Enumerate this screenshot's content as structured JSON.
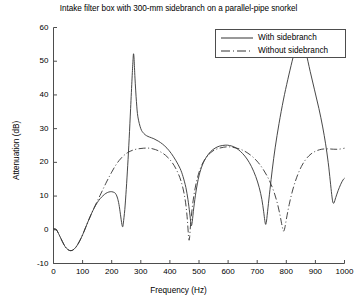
{
  "chart_data": {
    "type": "line",
    "title": "Intake filter box with 300-mm sidebranch on a parallel-pipe snorkel",
    "xlabel": "Frequency (Hz)",
    "ylabel": "Attenuation (dB)",
    "xlim": [
      0,
      1000
    ],
    "ylim": [
      -10,
      60
    ],
    "xticks": [
      0,
      100,
      200,
      300,
      400,
      500,
      600,
      700,
      800,
      900,
      1000
    ],
    "yticks": [
      -10,
      0,
      10,
      20,
      30,
      40,
      50,
      60
    ],
    "grid": false,
    "legend_position": "top-right",
    "series": [
      {
        "name": "With sidebranch",
        "style": "solid",
        "color": "#333333",
        "points": [
          [
            0,
            0.3
          ],
          [
            10,
            0.0
          ],
          [
            20,
            -1.6
          ],
          [
            30,
            -3.4
          ],
          [
            40,
            -5.0
          ],
          [
            50,
            -5.9
          ],
          [
            60,
            -6.2
          ],
          [
            70,
            -5.8
          ],
          [
            80,
            -4.8
          ],
          [
            90,
            -3.3
          ],
          [
            100,
            -1.5
          ],
          [
            110,
            0.6
          ],
          [
            120,
            2.7
          ],
          [
            130,
            4.7
          ],
          [
            140,
            6.5
          ],
          [
            150,
            8.0
          ],
          [
            160,
            9.2
          ],
          [
            170,
            10.1
          ],
          [
            180,
            10.8
          ],
          [
            190,
            11.2
          ],
          [
            200,
            11.3
          ],
          [
            210,
            11.0
          ],
          [
            215,
            10.5
          ],
          [
            220,
            9.4
          ],
          [
            225,
            7.5
          ],
          [
            230,
            4.6
          ],
          [
            235,
            1.6
          ],
          [
            238,
            0.9
          ],
          [
            240,
            2.0
          ],
          [
            245,
            6.0
          ],
          [
            250,
            12.0
          ],
          [
            255,
            19.0
          ],
          [
            260,
            27.0
          ],
          [
            265,
            36.0
          ],
          [
            270,
            45.0
          ],
          [
            273,
            50.0
          ],
          [
            275,
            52.2
          ],
          [
            277,
            50.5
          ],
          [
            280,
            45.0
          ],
          [
            285,
            38.0
          ],
          [
            290,
            33.5
          ],
          [
            300,
            30.0
          ],
          [
            310,
            28.6
          ],
          [
            320,
            27.9
          ],
          [
            330,
            27.5
          ],
          [
            345,
            27.0
          ],
          [
            360,
            26.3
          ],
          [
            375,
            25.4
          ],
          [
            390,
            24.2
          ],
          [
            405,
            22.6
          ],
          [
            420,
            20.6
          ],
          [
            435,
            18.2
          ],
          [
            445,
            15.8
          ],
          [
            455,
            12.5
          ],
          [
            462,
            9.0
          ],
          [
            468,
            5.0
          ],
          [
            472,
            2.0
          ],
          [
            474,
            1.2
          ],
          [
            477,
            2.5
          ],
          [
            482,
            6.5
          ],
          [
            490,
            11.5
          ],
          [
            500,
            16.0
          ],
          [
            512,
            19.3
          ],
          [
            525,
            21.5
          ],
          [
            540,
            23.2
          ],
          [
            555,
            24.2
          ],
          [
            570,
            24.8
          ],
          [
            590,
            25.1
          ],
          [
            605,
            25.0
          ],
          [
            620,
            24.6
          ],
          [
            635,
            23.8
          ],
          [
            650,
            22.6
          ],
          [
            665,
            21.0
          ],
          [
            680,
            18.8
          ],
          [
            695,
            15.8
          ],
          [
            707,
            12.5
          ],
          [
            716,
            9.0
          ],
          [
            722,
            5.5
          ],
          [
            726,
            2.8
          ],
          [
            729,
            1.6
          ],
          [
            732,
            2.6
          ],
          [
            737,
            6.5
          ],
          [
            744,
            12.0
          ],
          [
            752,
            18.0
          ],
          [
            762,
            24.5
          ],
          [
            775,
            31.5
          ],
          [
            790,
            38.5
          ],
          [
            805,
            44.5
          ],
          [
            820,
            50.0
          ],
          [
            833,
            54.5
          ],
          [
            843,
            57.0
          ],
          [
            850,
            57.8
          ],
          [
            857,
            56.5
          ],
          [
            868,
            52.5
          ],
          [
            882,
            47.0
          ],
          [
            897,
            41.5
          ],
          [
            912,
            36.0
          ],
          [
            925,
            30.5
          ],
          [
            935,
            25.5
          ],
          [
            944,
            20.0
          ],
          [
            951,
            14.5
          ],
          [
            956,
            10.5
          ],
          [
            960,
            8.2
          ],
          [
            964,
            8.0
          ],
          [
            970,
            9.6
          ],
          [
            978,
            11.6
          ],
          [
            987,
            13.5
          ],
          [
            995,
            14.8
          ],
          [
            1000,
            15.3
          ]
        ]
      },
      {
        "name": "Without sidebranch",
        "style": "dashdot",
        "color": "#333333",
        "points": [
          [
            0,
            0.3
          ],
          [
            10,
            0.0
          ],
          [
            20,
            -1.6
          ],
          [
            30,
            -3.4
          ],
          [
            40,
            -5.0
          ],
          [
            50,
            -5.9
          ],
          [
            60,
            -6.2
          ],
          [
            70,
            -5.8
          ],
          [
            80,
            -4.8
          ],
          [
            90,
            -3.3
          ],
          [
            100,
            -1.5
          ],
          [
            110,
            0.6
          ],
          [
            120,
            2.7
          ],
          [
            130,
            4.7
          ],
          [
            140,
            6.6
          ],
          [
            150,
            8.4
          ],
          [
            160,
            10.2
          ],
          [
            170,
            12.0
          ],
          [
            180,
            13.8
          ],
          [
            190,
            15.5
          ],
          [
            200,
            17.1
          ],
          [
            212,
            18.9
          ],
          [
            225,
            20.5
          ],
          [
            240,
            21.9
          ],
          [
            255,
            22.9
          ],
          [
            272,
            23.6
          ],
          [
            290,
            24.0
          ],
          [
            310,
            24.2
          ],
          [
            330,
            24.2
          ],
          [
            350,
            23.8
          ],
          [
            368,
            23.1
          ],
          [
            385,
            22.1
          ],
          [
            400,
            20.8
          ],
          [
            415,
            19.0
          ],
          [
            428,
            16.8
          ],
          [
            438,
            14.5
          ],
          [
            447,
            11.5
          ],
          [
            454,
            8.0
          ],
          [
            459,
            4.0
          ],
          [
            462,
            0.5
          ],
          [
            464,
            -2.0
          ],
          [
            466,
            -3.1
          ],
          [
            468,
            -2.0
          ],
          [
            471,
            1.5
          ],
          [
            476,
            6.0
          ],
          [
            483,
            10.5
          ],
          [
            492,
            14.5
          ],
          [
            503,
            17.8
          ],
          [
            516,
            20.3
          ],
          [
            531,
            22.1
          ],
          [
            548,
            23.4
          ],
          [
            566,
            24.1
          ],
          [
            585,
            24.5
          ],
          [
            605,
            24.6
          ],
          [
            625,
            24.3
          ],
          [
            645,
            23.8
          ],
          [
            665,
            22.9
          ],
          [
            685,
            21.6
          ],
          [
            703,
            20.0
          ],
          [
            720,
            18.0
          ],
          [
            735,
            15.8
          ],
          [
            748,
            13.4
          ],
          [
            760,
            10.6
          ],
          [
            770,
            7.6
          ],
          [
            778,
            4.5
          ],
          [
            784,
            1.8
          ],
          [
            788,
            0.2
          ],
          [
            791,
            -0.4
          ],
          [
            795,
            0.6
          ],
          [
            801,
            3.5
          ],
          [
            810,
            7.5
          ],
          [
            822,
            11.8
          ],
          [
            836,
            15.6
          ],
          [
            852,
            18.8
          ],
          [
            868,
            21.0
          ],
          [
            885,
            22.5
          ],
          [
            903,
            23.4
          ],
          [
            922,
            23.9
          ],
          [
            942,
            24.0
          ],
          [
            962,
            23.9
          ],
          [
            980,
            23.9
          ],
          [
            1000,
            24.2
          ]
        ]
      }
    ]
  },
  "legend": {
    "entries": [
      {
        "label": "With sidebranch"
      },
      {
        "label": "Without sidebranch"
      }
    ]
  },
  "axes": {
    "xticklabels": [
      "0",
      "100",
      "200",
      "300",
      "400",
      "500",
      "600",
      "700",
      "800",
      "900",
      "1000"
    ],
    "yticklabels": [
      "-10",
      "0",
      "10",
      "20",
      "30",
      "40",
      "50",
      "60"
    ]
  }
}
